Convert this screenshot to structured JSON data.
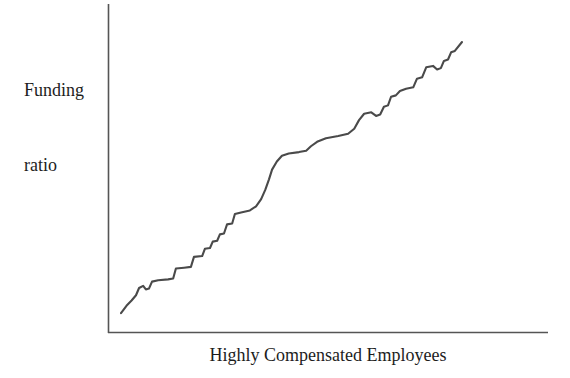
{
  "chart_data": {
    "type": "line",
    "title": "",
    "subtitle": "",
    "xlabel": "Highly Compensated Employees",
    "ylabel": "Funding ratio",
    "ylabel_lines": [
      "Funding",
      "ratio"
    ],
    "grid": false,
    "legend": null,
    "legend_position": "none",
    "x_tick_labels": [],
    "y_tick_labels": [],
    "xlim": [
      0,
      100
    ],
    "ylim": [
      0,
      100
    ],
    "annotations": [],
    "series": [
      {
        "name": "Funding ratio vs Highly Compensated Employees",
        "color": "#4a4a4a",
        "line_width": 2.1,
        "description": "Monotonically increasing staircase-like curve rising from lower left to upper right",
        "points": [
          [
            0.0,
            2.5
          ],
          [
            1.6,
            5.1
          ],
          [
            3.1,
            7.0
          ],
          [
            4.4,
            8.9
          ],
          [
            5.3,
            11.5
          ],
          [
            6.5,
            12.3
          ],
          [
            7.3,
            11.0
          ],
          [
            8.2,
            11.3
          ],
          [
            9.1,
            13.8
          ],
          [
            10.9,
            14.3
          ],
          [
            13.8,
            14.6
          ],
          [
            15.3,
            14.9
          ],
          [
            16.1,
            18.5
          ],
          [
            18.5,
            18.8
          ],
          [
            20.5,
            19.1
          ],
          [
            21.4,
            22.7
          ],
          [
            23.8,
            23.0
          ],
          [
            24.6,
            25.6
          ],
          [
            26.1,
            25.9
          ],
          [
            26.9,
            28.2
          ],
          [
            28.2,
            28.5
          ],
          [
            29.0,
            30.8
          ],
          [
            30.2,
            31.1
          ],
          [
            31.1,
            34.4
          ],
          [
            32.6,
            34.7
          ],
          [
            33.4,
            38.1
          ],
          [
            35.2,
            38.7
          ],
          [
            37.8,
            39.4
          ],
          [
            39.6,
            40.9
          ],
          [
            41.1,
            43.5
          ],
          [
            42.3,
            46.8
          ],
          [
            43.4,
            50.6
          ],
          [
            44.3,
            54.1
          ],
          [
            45.7,
            57.0
          ],
          [
            47.2,
            59.1
          ],
          [
            49.2,
            59.9
          ],
          [
            52.2,
            60.4
          ],
          [
            54.3,
            60.9
          ],
          [
            55.7,
            62.5
          ],
          [
            57.5,
            64.1
          ],
          [
            60.1,
            65.4
          ],
          [
            63.7,
            66.2
          ],
          [
            66.6,
            67.0
          ],
          [
            68.4,
            68.8
          ],
          [
            69.8,
            71.9
          ],
          [
            71.3,
            74.2
          ],
          [
            73.4,
            74.7
          ],
          [
            74.8,
            73.4
          ],
          [
            76.0,
            73.9
          ],
          [
            77.1,
            76.7
          ],
          [
            78.3,
            77.2
          ],
          [
            79.2,
            80.3
          ],
          [
            80.6,
            80.8
          ],
          [
            81.8,
            82.4
          ],
          [
            83.6,
            83.2
          ],
          [
            85.7,
            83.7
          ],
          [
            86.8,
            86.8
          ],
          [
            88.3,
            87.3
          ],
          [
            89.5,
            90.9
          ],
          [
            91.5,
            91.4
          ],
          [
            92.7,
            90.1
          ],
          [
            93.8,
            90.6
          ],
          [
            94.7,
            93.2
          ],
          [
            95.9,
            93.7
          ],
          [
            96.8,
            96.3
          ],
          [
            97.9,
            96.8
          ],
          [
            100.0,
            100.0
          ]
        ]
      }
    ],
    "colors": {
      "line": "#4a4a4a",
      "axis": "#555555",
      "text": "#1d1d1d",
      "background": "#ffffff"
    }
  }
}
